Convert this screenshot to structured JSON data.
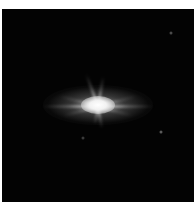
{
  "image": {
    "description": "Bright star with diffraction spikes on a black sky background",
    "background_color": "#030303",
    "frame_border_color": "#ffffff",
    "main_star": {
      "center_x": 96,
      "center_y": 96,
      "color": "#ffffff",
      "spike_angles_deg": [
        0,
        180,
        250,
        280,
        75,
        100,
        200,
        340,
        20,
        160
      ]
    },
    "faint_stars": [
      {
        "x": 169,
        "y": 24,
        "color": "#4a4a4a"
      },
      {
        "x": 81,
        "y": 129,
        "color": "#3a3a3a"
      },
      {
        "x": 159,
        "y": 123,
        "color": "#5a5a5a"
      }
    ]
  }
}
